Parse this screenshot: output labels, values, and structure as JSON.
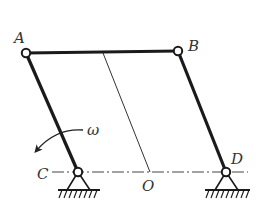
{
  "diagram": {
    "type": "four-bar linkage mechanism",
    "colors": {
      "link": "#1a1a1a",
      "thin_line": "#333333",
      "centerline": "#444444",
      "label": "#333333",
      "background": "#ffffff"
    },
    "joints": {
      "A": {
        "label": "A",
        "x": 26,
        "y": 53
      },
      "B": {
        "label": "B",
        "x": 178,
        "y": 51
      },
      "C": {
        "label": "C",
        "x": 78,
        "y": 172
      },
      "D": {
        "label": "D",
        "x": 226,
        "y": 172
      }
    },
    "links": [
      {
        "name": "coupler",
        "from": "A",
        "to": "B"
      },
      {
        "name": "crank",
        "from": "C",
        "to": "A"
      },
      {
        "name": "rocker",
        "from": "D",
        "to": "B"
      }
    ],
    "reference_point": {
      "label": "O"
    },
    "angular_velocity": {
      "label": "ω",
      "direction": "counterclockwise",
      "on_link": "CA"
    },
    "ground_line": {
      "style": "dash-dot",
      "through": [
        "C",
        "O",
        "D"
      ]
    },
    "supports": [
      {
        "at": "C",
        "type": "pin support"
      },
      {
        "at": "D",
        "type": "pin support"
      }
    ]
  }
}
